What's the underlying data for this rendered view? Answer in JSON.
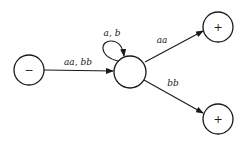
{
  "diagram": {
    "type": "finite-automaton",
    "nodes": [
      {
        "id": "start",
        "symbol": "−",
        "cx": 29,
        "cy": 70,
        "r": 15
      },
      {
        "id": "middle",
        "symbol": "",
        "cx": 130,
        "cy": 72,
        "r": 16
      },
      {
        "id": "final-top",
        "symbol": "+",
        "cx": 218,
        "cy": 27,
        "r": 15
      },
      {
        "id": "final-bottom",
        "symbol": "+",
        "cx": 218,
        "cy": 119,
        "r": 15
      }
    ],
    "edges": [
      {
        "from": "start",
        "to": "middle",
        "label": "aa, bb"
      },
      {
        "from": "middle",
        "to": "middle",
        "label": "a, b"
      },
      {
        "from": "middle",
        "to": "final-top",
        "label": "aa"
      },
      {
        "from": "middle",
        "to": "final-bottom",
        "label": "bb"
      }
    ]
  }
}
